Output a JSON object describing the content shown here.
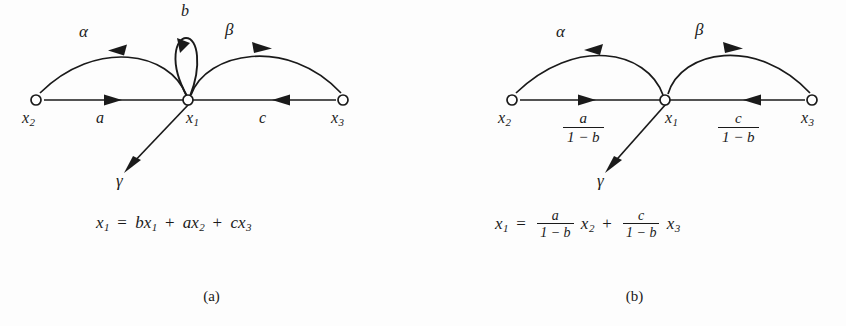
{
  "figure": {
    "type": "signal-flow-graph",
    "panels": [
      {
        "id": "a",
        "caption": "(a)",
        "nodes": [
          {
            "id": "x2",
            "label": "x",
            "subscript": "2",
            "x": 36,
            "y": 100
          },
          {
            "id": "x1",
            "label": "x",
            "subscript": "1",
            "x": 188,
            "y": 100
          },
          {
            "id": "x3",
            "label": "x",
            "subscript": "3",
            "x": 343,
            "y": 100
          }
        ],
        "edges": [
          {
            "id": "a-edge",
            "label": "a",
            "from": "x2",
            "to": "x1",
            "shape": "straight",
            "direction": "right"
          },
          {
            "id": "c-edge",
            "label": "c",
            "from": "x3",
            "to": "x1",
            "shape": "straight",
            "direction": "left"
          },
          {
            "id": "alpha-edge",
            "label": "α",
            "from": "x1",
            "to": "x2",
            "shape": "arc",
            "direction": "left"
          },
          {
            "id": "beta-edge",
            "label": "β",
            "from": "x1",
            "to": "x3",
            "shape": "arc",
            "direction": "right"
          },
          {
            "id": "b-loop",
            "label": "b",
            "from": "x1",
            "to": "x1",
            "shape": "self-loop",
            "direction": "counterclockwise"
          },
          {
            "id": "gamma-edge",
            "label": "γ",
            "from": "x1",
            "to": "output",
            "shape": "straight",
            "direction": "down-left"
          }
        ],
        "equation": {
          "lhs": "x",
          "lhs_sub": "1",
          "terms": [
            {
              "coefficient": "b",
              "variable": "x",
              "subscript": "1"
            },
            {
              "coefficient": "a",
              "variable": "x",
              "subscript": "2"
            },
            {
              "coefficient": "c",
              "variable": "x",
              "subscript": "3"
            }
          ],
          "equals": "=",
          "plus": "+"
        }
      },
      {
        "id": "b",
        "caption": "(b)",
        "nodes": [
          {
            "id": "x2",
            "label": "x",
            "subscript": "2",
            "x": 89,
            "y": 100
          },
          {
            "id": "x1",
            "label": "x",
            "subscript": "1",
            "x": 242,
            "y": 100
          },
          {
            "id": "x3",
            "label": "x",
            "subscript": "3",
            "x": 389,
            "y": 100
          }
        ],
        "edges": [
          {
            "id": "a-edge",
            "label_num": "a",
            "label_den": "1 − b",
            "from": "x2",
            "to": "x1",
            "shape": "straight",
            "direction": "right"
          },
          {
            "id": "c-edge",
            "label_num": "c",
            "label_den": "1 − b",
            "from": "x3",
            "to": "x1",
            "shape": "straight",
            "direction": "left"
          },
          {
            "id": "alpha-edge",
            "label": "α",
            "from": "x1",
            "to": "x2",
            "shape": "arc",
            "direction": "left"
          },
          {
            "id": "beta-edge",
            "label": "β",
            "from": "x1",
            "to": "x3",
            "shape": "arc",
            "direction": "right"
          },
          {
            "id": "gamma-edge",
            "label": "γ",
            "from": "x1",
            "to": "output",
            "shape": "straight",
            "direction": "down-left"
          }
        ],
        "equation": {
          "lhs": "x",
          "lhs_sub": "1",
          "equals": "=",
          "plus": "+",
          "terms": [
            {
              "num": "a",
              "den": "1 − b",
              "variable": "x",
              "subscript": "2"
            },
            {
              "num": "c",
              "den": "1 − b",
              "variable": "x",
              "subscript": "3"
            }
          ]
        }
      }
    ],
    "colors": {
      "stroke": "#1a1a1a",
      "background": "#fdfdfd",
      "node_fill": "#ffffff"
    }
  }
}
